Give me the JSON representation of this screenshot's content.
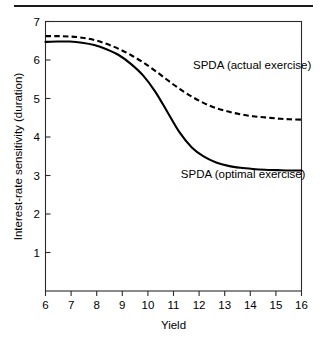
{
  "figure": {
    "has_top_rule": true,
    "background_color": "#ffffff",
    "ink_color": "#000000"
  },
  "chart_data": {
    "type": "line",
    "title": "",
    "subtitle": "",
    "xlabel": "Yield",
    "ylabel": "Interest-rate sensitivity (duration)",
    "xlim": [
      6,
      16.5
    ],
    "ylim": [
      0,
      7
    ],
    "grid": false,
    "legend_position": "inline-annotation",
    "xticks": [
      6,
      7,
      8,
      9,
      10,
      11,
      12,
      13,
      14,
      15,
      16
    ],
    "xtick_labels": [
      "6",
      "7",
      "8",
      "9",
      "10",
      "11",
      "12",
      "13",
      "14",
      "15",
      "16"
    ],
    "yticks": [
      1,
      2,
      3,
      4,
      5,
      6,
      7
    ],
    "ytick_labels": [
      "1",
      "2",
      "3",
      "4",
      "5",
      "6",
      "7"
    ],
    "x": [
      6,
      6.5,
      7,
      7.5,
      8,
      8.5,
      9,
      9.5,
      10,
      10.5,
      11,
      11.5,
      12,
      12.5,
      13,
      13.5,
      14,
      14.5,
      15,
      15.5,
      16,
      16.5
    ],
    "series": [
      {
        "name": "SPDA (actual exercise)",
        "style": "dashed",
        "color": "#000000",
        "label_x": 12.05,
        "label_y": 5.77,
        "values": [
          6.62,
          6.62,
          6.61,
          6.58,
          6.52,
          6.42,
          6.29,
          6.13,
          5.94,
          5.72,
          5.48,
          5.25,
          5.05,
          4.88,
          4.75,
          4.66,
          4.59,
          4.54,
          4.51,
          4.48,
          4.46,
          4.45
        ]
      },
      {
        "name": "SPDA (optimal exercise)",
        "style": "solid",
        "color": "#000000",
        "label_x": 11.55,
        "label_y": 2.93,
        "values": [
          6.47,
          6.48,
          6.48,
          6.45,
          6.39,
          6.28,
          6.13,
          5.9,
          5.6,
          5.18,
          4.65,
          4.12,
          3.73,
          3.49,
          3.34,
          3.25,
          3.2,
          3.17,
          3.15,
          3.14,
          3.13,
          3.13
        ]
      }
    ]
  }
}
